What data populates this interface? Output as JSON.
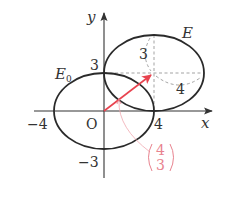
{
  "diagram": {
    "type": "ellipse-translation",
    "axes": {
      "x_label": "x",
      "y_label": "y",
      "origin_label": "O"
    },
    "ticks": {
      "x_neg": "−4",
      "x_pos": "4",
      "y_pos": "3",
      "y_neg": "−3"
    },
    "ellipses": [
      {
        "name": "E0",
        "label_main": "E",
        "label_sub": "0",
        "center": [
          0,
          0
        ],
        "a": 4,
        "b": 3
      },
      {
        "name": "E",
        "label_main": "E",
        "center": [
          4,
          3
        ],
        "a": 4,
        "b": 3
      }
    ],
    "translation_vector": {
      "components": [
        4,
        3
      ],
      "top": "4",
      "bottom": "3",
      "color": "#e8434f"
    },
    "dimension_labels": {
      "vertical_semi_axis": "3",
      "horizontal_semi_axis": "4"
    },
    "colors": {
      "curve": "#2a2a2a",
      "axis": "#333333",
      "vector": "#e8434f",
      "vector_label": "#e8838f",
      "dashed": "#888888"
    }
  }
}
